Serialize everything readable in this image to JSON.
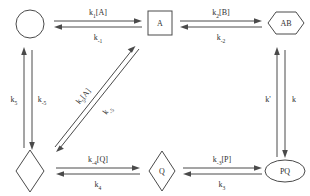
{
  "diagram": {
    "line_color": "#4a4a4a",
    "text_color": "#303030",
    "background": "#ffffff",
    "nodes": [
      {
        "id": "node-circle-empty",
        "shape": "circle",
        "label": ""
      },
      {
        "id": "node-square-a",
        "shape": "square",
        "label": "A"
      },
      {
        "id": "node-hexagon-ab",
        "shape": "hexagon",
        "label": "AB"
      },
      {
        "id": "node-diamond-empty",
        "shape": "diamond",
        "label": ""
      },
      {
        "id": "node-diamond-q",
        "shape": "diamond",
        "label": "Q"
      },
      {
        "id": "node-ellipse-pq",
        "shape": "ellipse",
        "label": "PQ"
      }
    ],
    "rates": {
      "top_left_forward": {
        "k": "k",
        "sub": "1",
        "species": "[A]"
      },
      "top_left_reverse": {
        "k": "k",
        "sub": "-1",
        "species": ""
      },
      "top_right_forward": {
        "k": "k",
        "sub": "2",
        "species": "[B]"
      },
      "top_right_reverse": {
        "k": "k",
        "sub": "-2",
        "species": ""
      },
      "bottom_left_forward": {
        "k": "k",
        "sub": "-4",
        "species": "[Q]"
      },
      "bottom_left_reverse": {
        "k": "k",
        "sub": "4",
        "species": ""
      },
      "bottom_right_forward": {
        "k": "k",
        "sub": "-3",
        "species": "[P]"
      },
      "bottom_right_reverse": {
        "k": "k",
        "sub": "3",
        "species": ""
      },
      "left_up": {
        "k": "k",
        "sub": "5",
        "species": ""
      },
      "left_down": {
        "k": "k",
        "sub": "-5",
        "species": ""
      },
      "right_up": {
        "k": "k'",
        "sub": "",
        "species": ""
      },
      "right_down": {
        "k": "k",
        "sub": "",
        "species": ""
      },
      "diagonal_upper": {
        "k": "k",
        "sub": "5",
        "species": "[A]"
      },
      "diagonal_lower": {
        "k": "k",
        "sub": "-5",
        "species": ""
      }
    }
  }
}
